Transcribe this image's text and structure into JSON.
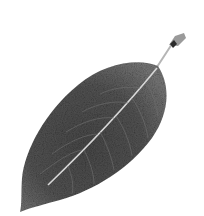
{
  "image": {
    "subject": "leaf",
    "description": "Single grayscale leaf with visible midrib and veins, diagonal orientation, stem at upper right, on white background",
    "colors": {
      "background": "#ffffff",
      "leaf_dark": "#3a3a3a",
      "leaf_mid": "#5c5c5c",
      "leaf_light": "#7a7a7a",
      "midrib": "#d8d8d8",
      "stem": "#8a8a8a",
      "stem_tip": "#2a2a2a"
    }
  }
}
